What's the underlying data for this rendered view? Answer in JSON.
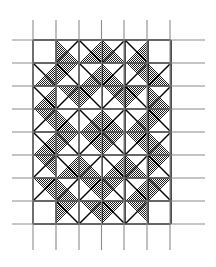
{
  "figure": {
    "kind": "quilt-block-pattern-diagram",
    "canvas": {
      "width": 216,
      "height": 267
    },
    "background_color": "#ffffff"
  },
  "grid": {
    "description": "Thin gray reference grid drawn over and beyond the pieced pattern",
    "line_color": "#8c8c8c",
    "line_width": 1.1,
    "vertical_lines_x": [
      33,
      56,
      79,
      101.5,
      124,
      147,
      170
    ],
    "vertical_line_y_start": 20,
    "vertical_line_y_end": 250,
    "horizontal_lines_y": [
      40,
      63,
      86,
      109,
      132,
      155,
      178,
      201,
      224
    ],
    "horizontal_line_x_start": 12,
    "horizontal_line_x_end": 205
  },
  "pattern": {
    "origin_x": 33,
    "origin_y": 40,
    "cell_size": 23,
    "columns": 6,
    "rows": 8,
    "fill_color": "#4a4a4a",
    "fill_texture": "fine checkerboard dither",
    "outline_color": "#000000",
    "outline_width": 1.4,
    "symmetry": "mirror left-right and top-bottom",
    "cells": [
      {
        "row": 0,
        "col": 0,
        "type": "empty"
      },
      {
        "row": 0,
        "col": 1,
        "type": "tri-bl"
      },
      {
        "row": 0,
        "col": 2,
        "type": "tri-br"
      },
      {
        "row": 0,
        "col": 3,
        "type": "tri-bl"
      },
      {
        "row": 0,
        "col": 4,
        "type": "tri-br"
      },
      {
        "row": 0,
        "col": 5,
        "type": "empty"
      },
      {
        "row": 1,
        "col": 0,
        "type": "tri-br"
      },
      {
        "row": 1,
        "col": 1,
        "type": "tri-tl"
      },
      {
        "row": 1,
        "col": 2,
        "type": "tri-br"
      },
      {
        "row": 1,
        "col": 3,
        "type": "tri-bl"
      },
      {
        "row": 1,
        "col": 4,
        "type": "tri-tr"
      },
      {
        "row": 1,
        "col": 5,
        "type": "tri-bl"
      },
      {
        "row": 2,
        "col": 0,
        "type": "tri-br"
      },
      {
        "row": 2,
        "col": 1,
        "type": "tri-tr"
      },
      {
        "row": 2,
        "col": 2,
        "type": "tri-tl"
      },
      {
        "row": 2,
        "col": 3,
        "type": "tri-tr"
      },
      {
        "row": 2,
        "col": 4,
        "type": "tri-tl"
      },
      {
        "row": 2,
        "col": 5,
        "type": "tri-bl"
      },
      {
        "row": 3,
        "col": 0,
        "type": "tri-tr"
      },
      {
        "row": 3,
        "col": 1,
        "type": "tri-bl"
      },
      {
        "row": 3,
        "col": 2,
        "type": "tri-br"
      },
      {
        "row": 3,
        "col": 3,
        "type": "tri-bl"
      },
      {
        "row": 3,
        "col": 4,
        "type": "tri-br"
      },
      {
        "row": 3,
        "col": 5,
        "type": "tri-tl"
      },
      {
        "row": 4,
        "col": 0,
        "type": "tri-br"
      },
      {
        "row": 4,
        "col": 1,
        "type": "tri-tl"
      },
      {
        "row": 4,
        "col": 2,
        "type": "tri-tr"
      },
      {
        "row": 4,
        "col": 3,
        "type": "tri-tl"
      },
      {
        "row": 4,
        "col": 4,
        "type": "tri-tr"
      },
      {
        "row": 4,
        "col": 5,
        "type": "tri-bl"
      },
      {
        "row": 5,
        "col": 0,
        "type": "tri-tr"
      },
      {
        "row": 5,
        "col": 1,
        "type": "tri-br"
      },
      {
        "row": 5,
        "col": 2,
        "type": "tri-bl"
      },
      {
        "row": 5,
        "col": 3,
        "type": "tri-br"
      },
      {
        "row": 5,
        "col": 4,
        "type": "tri-bl"
      },
      {
        "row": 5,
        "col": 5,
        "type": "tri-tl"
      },
      {
        "row": 6,
        "col": 0,
        "type": "tri-tr"
      },
      {
        "row": 6,
        "col": 1,
        "type": "tri-bl"
      },
      {
        "row": 6,
        "col": 2,
        "type": "tri-tr"
      },
      {
        "row": 6,
        "col": 3,
        "type": "tri-tl"
      },
      {
        "row": 6,
        "col": 4,
        "type": "tri-br"
      },
      {
        "row": 6,
        "col": 5,
        "type": "tri-tl"
      },
      {
        "row": 7,
        "col": 0,
        "type": "empty"
      },
      {
        "row": 7,
        "col": 1,
        "type": "tri-tl"
      },
      {
        "row": 7,
        "col": 2,
        "type": "tri-tr"
      },
      {
        "row": 7,
        "col": 3,
        "type": "tri-tl"
      },
      {
        "row": 7,
        "col": 4,
        "type": "tri-tr"
      },
      {
        "row": 7,
        "col": 5,
        "type": "empty"
      }
    ],
    "seam_lines": [
      {
        "row": 0,
        "col": 1,
        "dir": "anti"
      },
      {
        "row": 0,
        "col": 2,
        "dir": "main"
      },
      {
        "row": 0,
        "col": 3,
        "dir": "anti"
      },
      {
        "row": 0,
        "col": 4,
        "dir": "main"
      },
      {
        "row": 1,
        "col": 0,
        "dir": "main"
      },
      {
        "row": 1,
        "col": 1,
        "dir": "main"
      },
      {
        "row": 1,
        "col": 2,
        "dir": "main"
      },
      {
        "row": 1,
        "col": 3,
        "dir": "anti"
      },
      {
        "row": 1,
        "col": 4,
        "dir": "anti"
      },
      {
        "row": 1,
        "col": 5,
        "dir": "anti"
      },
      {
        "row": 2,
        "col": 0,
        "dir": "main"
      },
      {
        "row": 2,
        "col": 1,
        "dir": "anti"
      },
      {
        "row": 2,
        "col": 2,
        "dir": "main"
      },
      {
        "row": 2,
        "col": 3,
        "dir": "anti"
      },
      {
        "row": 2,
        "col": 4,
        "dir": "main"
      },
      {
        "row": 2,
        "col": 5,
        "dir": "anti"
      },
      {
        "row": 3,
        "col": 0,
        "dir": "anti"
      },
      {
        "row": 3,
        "col": 1,
        "dir": "anti"
      },
      {
        "row": 3,
        "col": 2,
        "dir": "main"
      },
      {
        "row": 3,
        "col": 3,
        "dir": "anti"
      },
      {
        "row": 3,
        "col": 4,
        "dir": "main"
      },
      {
        "row": 3,
        "col": 5,
        "dir": "main"
      },
      {
        "row": 4,
        "col": 0,
        "dir": "main"
      },
      {
        "row": 4,
        "col": 1,
        "dir": "main"
      },
      {
        "row": 4,
        "col": 2,
        "dir": "anti"
      },
      {
        "row": 4,
        "col": 3,
        "dir": "main"
      },
      {
        "row": 4,
        "col": 4,
        "dir": "anti"
      },
      {
        "row": 4,
        "col": 5,
        "dir": "anti"
      },
      {
        "row": 5,
        "col": 0,
        "dir": "anti"
      },
      {
        "row": 5,
        "col": 1,
        "dir": "main"
      },
      {
        "row": 5,
        "col": 2,
        "dir": "anti"
      },
      {
        "row": 5,
        "col": 3,
        "dir": "main"
      },
      {
        "row": 5,
        "col": 4,
        "dir": "anti"
      },
      {
        "row": 5,
        "col": 5,
        "dir": "main"
      },
      {
        "row": 6,
        "col": 0,
        "dir": "anti"
      },
      {
        "row": 6,
        "col": 1,
        "dir": "anti"
      },
      {
        "row": 6,
        "col": 2,
        "dir": "anti"
      },
      {
        "row": 6,
        "col": 3,
        "dir": "main"
      },
      {
        "row": 6,
        "col": 4,
        "dir": "main"
      },
      {
        "row": 6,
        "col": 5,
        "dir": "main"
      },
      {
        "row": 7,
        "col": 1,
        "dir": "main"
      },
      {
        "row": 7,
        "col": 2,
        "dir": "anti"
      },
      {
        "row": 7,
        "col": 3,
        "dir": "main"
      },
      {
        "row": 7,
        "col": 4,
        "dir": "anti"
      }
    ]
  }
}
